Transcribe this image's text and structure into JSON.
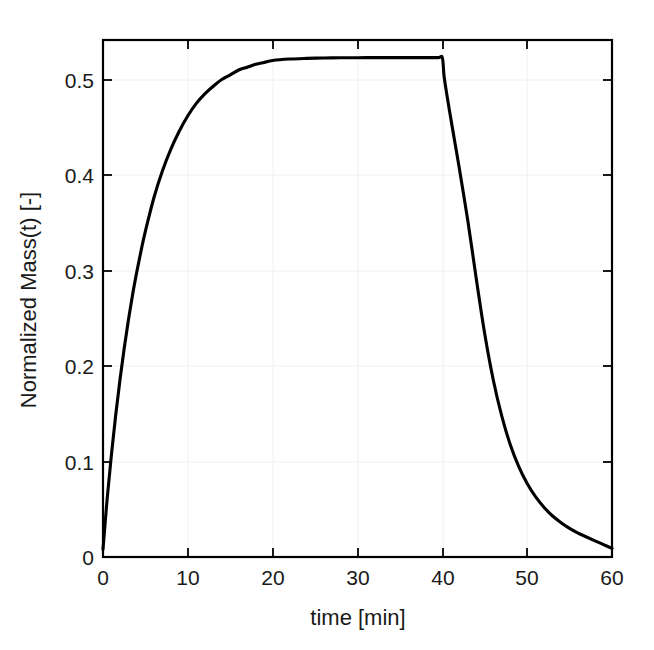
{
  "chart_data": {
    "type": "line",
    "title": "",
    "xlabel": "time [min]",
    "ylabel": "Normalized Mass(t) [-]",
    "xlim": [
      0,
      60
    ],
    "ylim": [
      0,
      0.5425
    ],
    "xticks": [
      0,
      10,
      20,
      30,
      40,
      50,
      60
    ],
    "xticklabels": [
      "0",
      "10",
      "20",
      "30",
      "40",
      "50",
      "60"
    ],
    "yticks": [
      0,
      0.1,
      0.2,
      0.3,
      0.4,
      0.5
    ],
    "yticklabels": [
      "0",
      "0.1",
      "0.2",
      "0.3",
      "0.4",
      "0.5"
    ],
    "grid": false,
    "legend": null,
    "line_color": "#000000",
    "line_width": 3.1,
    "background_color": "#ffffff",
    "axis_color": "#000000",
    "tick_direction": "in",
    "box": true,
    "series": [
      {
        "name": "Normalized Mass(t)",
        "x": [
          0,
          0.5,
          1,
          1.5,
          2,
          2.5,
          3,
          3.5,
          4,
          4.5,
          5,
          6,
          7,
          8,
          9,
          10,
          11,
          12,
          13,
          14,
          15,
          16,
          17,
          18,
          19,
          20,
          22,
          24,
          26,
          28,
          30,
          32,
          34,
          36,
          38,
          39.5,
          40,
          40.2,
          40.5,
          41,
          41.5,
          42,
          42.5,
          43,
          43.5,
          44,
          45,
          46,
          47,
          48,
          49,
          50,
          51,
          52,
          53,
          54,
          55,
          56,
          57,
          58,
          59,
          60
        ],
        "y": [
          0.008,
          0.062,
          0.108,
          0.149,
          0.186,
          0.219,
          0.249,
          0.276,
          0.3,
          0.322,
          0.342,
          0.377,
          0.405,
          0.428,
          0.447,
          0.463,
          0.476,
          0.486,
          0.494,
          0.501,
          0.506,
          0.511,
          0.514,
          0.517,
          0.519,
          0.521,
          0.5225,
          0.5232,
          0.5236,
          0.5238,
          0.5239,
          0.524,
          0.524,
          0.524,
          0.524,
          0.524,
          0.524,
          0.505,
          0.487,
          0.46,
          0.434,
          0.408,
          0.381,
          0.353,
          0.323,
          0.292,
          0.234,
          0.186,
          0.148,
          0.118,
          0.095,
          0.077,
          0.063,
          0.052,
          0.043,
          0.036,
          0.03,
          0.025,
          0.021,
          0.017,
          0.013,
          0.009
        ]
      }
    ],
    "annotations": [
      {
        "label": "peak-plateau-value",
        "value": 0.524,
        "x": 40
      },
      {
        "label": "switch-off-time",
        "value": 40,
        "unit": "min"
      },
      {
        "label": "final-value",
        "value": 0.009,
        "x": 60
      }
    ]
  },
  "figure": {
    "xlabel": "time [min]",
    "ylabel": "Normalized Mass(t) [-]"
  }
}
